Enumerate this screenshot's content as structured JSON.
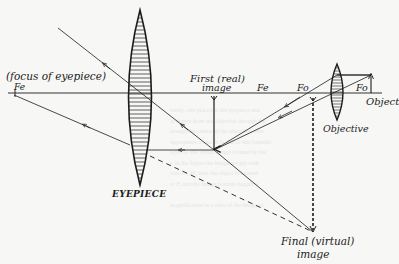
{
  "diagram": {
    "colors": {
      "ink": "#1c1c1c",
      "paper": "#f7f7f5",
      "ghost_text": "#e6e6e3"
    },
    "labels": {
      "focus_eyepiece_note": "(focus of eyepiece)",
      "fe_left": "Fe",
      "first_image_line1": "First (real)",
      "first_image_line2": "image",
      "fe_mid": "Fe",
      "fo_left": "Fo",
      "fo_right": "Fo",
      "object": "Object",
      "objective": "Objective",
      "eyepiece": "EYEPIECE",
      "final_image_line1": "Final (virtual)",
      "final_image_line2": "image"
    },
    "components": [
      {
        "id": "eyepiece-lens",
        "type": "convex lens",
        "label": "EYEPIECE"
      },
      {
        "id": "objective-lens",
        "type": "convex lens",
        "label": "Objective"
      },
      {
        "id": "object-arrow",
        "type": "arrow",
        "label": "Object"
      },
      {
        "id": "first-image-arrow",
        "type": "arrow",
        "label": "First (real) image"
      },
      {
        "id": "final-image-line",
        "type": "dashed line",
        "label": "Final (virtual) image"
      }
    ],
    "ghost_text_lines": [
      "rently, one placed at the eyepiece and",
      "ly drawn from the objective through the",
      "nrough the centre of the objective, thus",
      "appropriate focus. It is due to this formula",
      "rays i.e. the virtual image formed by the",
      "r. In the figure the image we get with",
      "ront Fe, W, near the object is formed",
      "or F, and the image is made negative",
      "",
      "magnification is a ratio of the image to"
    ]
  }
}
